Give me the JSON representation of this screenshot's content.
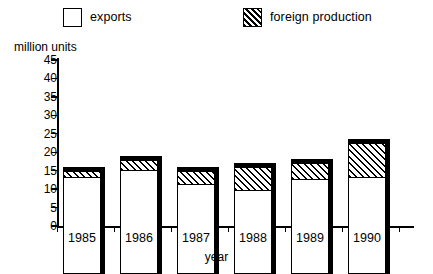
{
  "legend": {
    "items": [
      {
        "label": "exports",
        "swatch": "white-square-icon"
      },
      {
        "label": "foreign production",
        "swatch": "hatched-square-icon"
      }
    ]
  },
  "axes": {
    "y_title": "million units",
    "x_title": "year",
    "y_ticks": [
      "45",
      "40",
      "35",
      "30",
      "25",
      "20",
      "15",
      "10",
      "5",
      "0"
    ],
    "x_ticks": [
      "1985",
      "1986",
      "1987",
      "1988",
      "1989",
      "1990"
    ]
  },
  "chart_data": {
    "type": "bar",
    "stacked": true,
    "title": "",
    "xlabel": "year",
    "ylabel": "million units",
    "ylim": [
      0,
      45
    ],
    "ytick_step": 5,
    "grid": false,
    "legend_position": "top",
    "categories": [
      "1985",
      "1986",
      "1987",
      "1988",
      "1989",
      "1990"
    ],
    "series": [
      {
        "name": "exports",
        "values": [
          26,
          28,
          24,
          22.5,
          25.5,
          26
        ]
      },
      {
        "name": "foreign production",
        "values": [
          2,
          3,
          4,
          6.5,
          4.5,
          9.5
        ]
      }
    ],
    "totals": [
      28,
      31,
      28,
      29,
      30,
      35.5
    ]
  },
  "colors": {
    "ink": "#000000",
    "background": "#ffffff"
  }
}
